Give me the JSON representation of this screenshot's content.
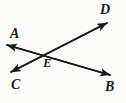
{
  "figure": {
    "type": "geometry-diagram",
    "background_color": "#fcfcfb",
    "stroke_color": "#1a1a1a",
    "labels": {
      "a": "A",
      "b": "B",
      "c": "C",
      "d": "D",
      "e": "E"
    },
    "points": [
      {
        "name": "A",
        "label": "A",
        "x": 7,
        "y": 45
      },
      {
        "name": "B",
        "label": "B",
        "x": 110,
        "y": 75
      },
      {
        "name": "C",
        "label": "C",
        "x": 11,
        "y": 72
      },
      {
        "name": "D",
        "label": "D",
        "x": 107,
        "y": 23
      },
      {
        "name": "E",
        "label": "E",
        "x": 45,
        "y": 53
      }
    ],
    "lines": [
      {
        "name": "line-AB",
        "from": "A",
        "to": "B",
        "arrow_start": true,
        "arrow_end": true
      },
      {
        "name": "line-CD",
        "from": "C",
        "to": "D",
        "arrow_start": true,
        "arrow_end": true
      }
    ]
  }
}
